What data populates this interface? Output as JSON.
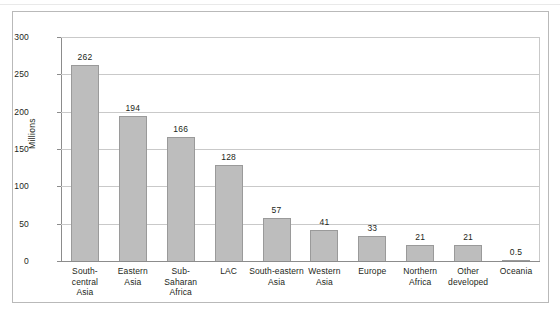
{
  "chart_data": {
    "type": "bar",
    "title": "",
    "subtitle": "",
    "xlabel": "",
    "ylabel": "Millions",
    "ylim": [
      0,
      300
    ],
    "ytick_values": [
      300,
      250,
      200,
      150,
      100,
      50,
      0
    ],
    "ytick_labels": [
      "300",
      "250",
      "200",
      "150",
      "100",
      "50",
      "0"
    ],
    "grid": true,
    "legend": false,
    "legend_position": "none",
    "bar_color": "#bdbdbd",
    "bar_edge_color": "#9a9a9a",
    "categories": [
      "South-central Asia",
      "Eastern Asia",
      "Sub-Saharan Africa",
      "LAC",
      "South-eastern Asia",
      "Western Asia",
      "Europe",
      "Northern Africa",
      "Other developed",
      "Oceania"
    ],
    "category_label_lines": [
      [
        "South-",
        "central",
        "Asia"
      ],
      [
        "Eastern",
        "Asia"
      ],
      [
        "Sub-",
        "Saharan",
        "Africa"
      ],
      [
        "LAC"
      ],
      [
        "South-eastern",
        "Asia"
      ],
      [
        "Western",
        "Asia"
      ],
      [
        "Europe"
      ],
      [
        "Northern",
        "Africa"
      ],
      [
        "Other",
        "developed"
      ],
      [
        "Oceania"
      ]
    ],
    "values": [
      262,
      194,
      166,
      128,
      57,
      41,
      33,
      21,
      21,
      0.5
    ],
    "data_labels": [
      "262",
      "194",
      "166",
      "128",
      "57",
      "41",
      "33",
      "21",
      "21",
      "0.5"
    ]
  }
}
